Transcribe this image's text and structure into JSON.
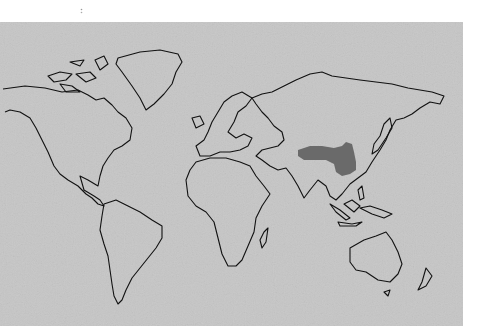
{
  "map": {
    "type": "world outline map",
    "background_color": "#c6c6c6",
    "outline_color": "#111111",
    "highlight_color": "#6a6a6a",
    "highlighted_region": "China (eastern/central)",
    "description": "World map with continent outlines; a region of East Asia (China) is shaded dark gray"
  }
}
